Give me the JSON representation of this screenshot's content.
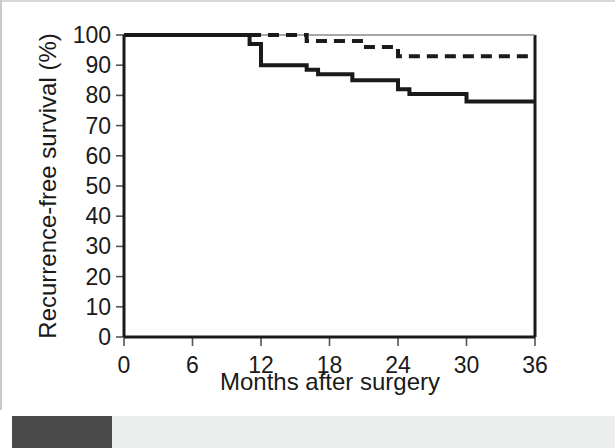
{
  "figure": {
    "caption_none": "",
    "background_color": "#ffffff",
    "ink_color": "#1a1a1a"
  },
  "chart_data": {
    "type": "line",
    "subtype": "kaplan-meier-step",
    "title": "",
    "xlabel": "Months after surgery",
    "ylabel": "Recurrence-free survival (%)",
    "xlim": [
      0,
      36
    ],
    "ylim": [
      0,
      100
    ],
    "xticks": [
      0,
      6,
      12,
      18,
      24,
      30,
      36
    ],
    "yticks": [
      0,
      10,
      20,
      30,
      40,
      50,
      60,
      70,
      80,
      90,
      100
    ],
    "xticklabels": [
      "0",
      "6",
      "12",
      "18",
      "24",
      "30",
      "36"
    ],
    "yticklabels": [
      "0",
      "10",
      "20",
      "30",
      "40",
      "50",
      "60",
      "70",
      "80",
      "90",
      "100"
    ],
    "grid": false,
    "legend": "none",
    "series": [
      {
        "name": "solid-curve",
        "style": "solid",
        "color": "#1a1a1a",
        "linewidth": 4,
        "x": [
          0,
          11,
          11,
          12,
          12,
          16,
          16,
          17,
          17,
          20,
          20,
          24,
          24,
          25,
          25,
          30,
          30,
          36
        ],
        "y": [
          100,
          100,
          97,
          97,
          90,
          90,
          88.5,
          88.5,
          87,
          87,
          85,
          85,
          82,
          82,
          80.5,
          80.5,
          78,
          78
        ]
      },
      {
        "name": "dashed-curve",
        "style": "dashed",
        "color": "#1a1a1a",
        "linewidth": 4,
        "x": [
          0,
          16,
          16,
          21,
          21,
          24,
          24,
          36
        ],
        "y": [
          100,
          100,
          98,
          98,
          96,
          96,
          93,
          93
        ]
      }
    ],
    "annotations": []
  },
  "axes": {
    "x_axis_name": "x-axis",
    "y_axis_name": "y-axis",
    "frame": "box-open-right-partial"
  }
}
